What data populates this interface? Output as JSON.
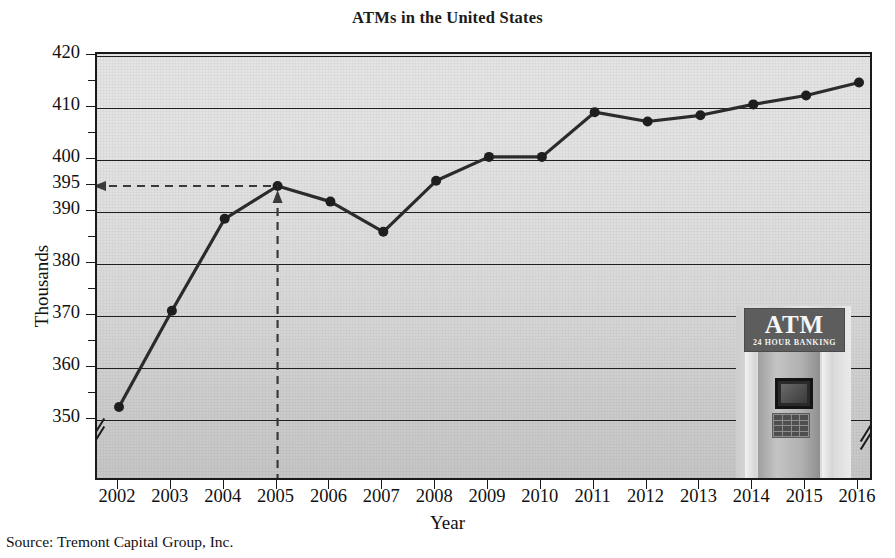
{
  "chart_data": {
    "type": "line",
    "title": "ATMs in the United States",
    "xlabel": "Year",
    "ylabel": "Thousands",
    "categories": [
      2002,
      2003,
      2004,
      2005,
      2006,
      2007,
      2008,
      2009,
      2010,
      2011,
      2012,
      2013,
      2014,
      2015,
      2016
    ],
    "values": [
      352.5,
      371.0,
      388.7,
      395.0,
      392.0,
      386.2,
      396.0,
      400.6,
      400.6,
      409.2,
      407.4,
      408.6,
      410.7,
      412.4,
      414.9
    ],
    "ylim": [
      348,
      420
    ],
    "yticks_major": [
      350,
      360,
      370,
      380,
      390,
      395,
      400,
      410,
      420
    ],
    "yticks_minor": [
      355,
      365,
      375,
      385,
      405,
      415
    ],
    "xlim": [
      2002,
      2016
    ],
    "grid": "horizontal",
    "legend": "none",
    "marker": "filled-circle",
    "line_color": "#2b2b2b",
    "plot_background": "#dcdcdc",
    "axis_break_y": true,
    "axis_break_x": true,
    "annotation": {
      "type": "dashed-guide",
      "value_label": "395",
      "at_category": 2005,
      "description": "dashed horizontal arrow from 395 on the y-axis to the 2005 data point, plus dashed vertical arrow from the 2005 x-axis tick up to the data point"
    }
  },
  "axes": {
    "y_tick_labels": [
      "420",
      "410",
      "400",
      "395",
      "390",
      "380",
      "370",
      "360",
      "350"
    ],
    "x_tick_labels": [
      "2002",
      "2003",
      "2004",
      "2005",
      "2006",
      "2007",
      "2008",
      "2009",
      "2010",
      "2011",
      "2012",
      "2013",
      "2014",
      "2015",
      "2016"
    ]
  },
  "title": "ATMs in the United States",
  "y_axis_title": "Thousands",
  "x_axis_title": "Year",
  "source_note": "Source: Tremont Capital Group, Inc.",
  "atm_photo": {
    "sign_main": "ATM",
    "sign_sub": "24 HOUR BANKING"
  }
}
